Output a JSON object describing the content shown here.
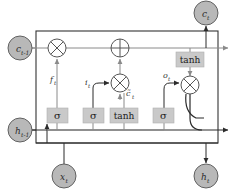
{
  "figure": {
    "type": "lstm-cell-diagram",
    "background": "#ffffff",
    "cell_border_color": "#333333",
    "wire_color": "#8a8a8a",
    "dark_wire_color": "#2b2b2b",
    "node_fill": "#b8b8b8",
    "node_stroke": "#555555",
    "gate_fill": "#c9c9c9",
    "gate_stroke": "#9a9a9a"
  },
  "cell_box": {
    "name": "lstm-cell-boundary",
    "x": 36,
    "y": 31,
    "width": 182,
    "height": 112
  },
  "state_nodes": [
    {
      "id": "c-prev",
      "label": "c",
      "subscript": "t-1",
      "description": "previous cell state input",
      "cx": 20,
      "cy": 48,
      "r": 12
    },
    {
      "id": "h-prev",
      "label": "h",
      "subscript": "t-1",
      "description": "previous hidden state input",
      "cx": 20,
      "cy": 130,
      "r": 12
    },
    {
      "id": "x-t",
      "label": "x",
      "subscript": "t",
      "description": "current input vector",
      "cx": 64,
      "cy": 176,
      "r": 12
    },
    {
      "id": "c-t",
      "label": "c",
      "subscript": "t",
      "description": "current cell state output",
      "cx": 206,
      "cy": 13,
      "r": 12
    },
    {
      "id": "h-t",
      "label": "h",
      "subscript": "t",
      "description": "current hidden state output",
      "cx": 206,
      "cy": 176,
      "r": 12
    }
  ],
  "operators": [
    {
      "id": "forget-multiply",
      "symbol": "multiply",
      "description": "forget gate pointwise multiplication",
      "cx": 57,
      "cy": 48,
      "r": 9
    },
    {
      "id": "state-add",
      "symbol": "plus",
      "description": "cell state pointwise addition",
      "cx": 120,
      "cy": 48,
      "r": 9
    },
    {
      "id": "input-multiply",
      "symbol": "multiply",
      "description": "input gate pointwise multiplication",
      "cx": 120,
      "cy": 83,
      "r": 9
    },
    {
      "id": "output-multiply",
      "symbol": "multiply",
      "description": "output gate pointwise multiplication",
      "cx": 190,
      "cy": 85,
      "r": 9
    }
  ],
  "gates": [
    {
      "id": "forget-gate",
      "text": "σ",
      "description": "forget gate sigmoid activation",
      "x": 47,
      "y": 108,
      "width": 21,
      "height": 15
    },
    {
      "id": "input-gate",
      "text": "σ",
      "description": "input gate sigmoid activation",
      "x": 83,
      "y": 108,
      "width": 21,
      "height": 15
    },
    {
      "id": "candidate-gate",
      "text": "tanh",
      "description": "candidate cell state tanh activation",
      "x": 110,
      "y": 108,
      "width": 28,
      "height": 15
    },
    {
      "id": "output-gate",
      "text": "σ",
      "description": "output gate sigmoid activation",
      "x": 153,
      "y": 108,
      "width": 21,
      "height": 15
    },
    {
      "id": "output-tanh",
      "text": "tanh",
      "description": "cell state tanh squashing",
      "x": 176,
      "y": 52,
      "width": 28,
      "height": 15
    }
  ],
  "edge_labels": [
    {
      "id": "forget-label",
      "label": "f",
      "subscript": "t",
      "description": "forget gate activation vector",
      "x": 50,
      "y": 82
    },
    {
      "id": "input-label",
      "label": "i",
      "subscript": "t",
      "description": "input gate activation vector",
      "x": 85,
      "y": 85
    },
    {
      "id": "candidate-label",
      "label": "c̃",
      "subscript": "t",
      "description": "candidate cell state vector",
      "x": 126,
      "y": 96
    },
    {
      "id": "output-label",
      "label": "o",
      "subscript": "t",
      "description": "output gate activation vector",
      "x": 163,
      "y": 78
    }
  ]
}
